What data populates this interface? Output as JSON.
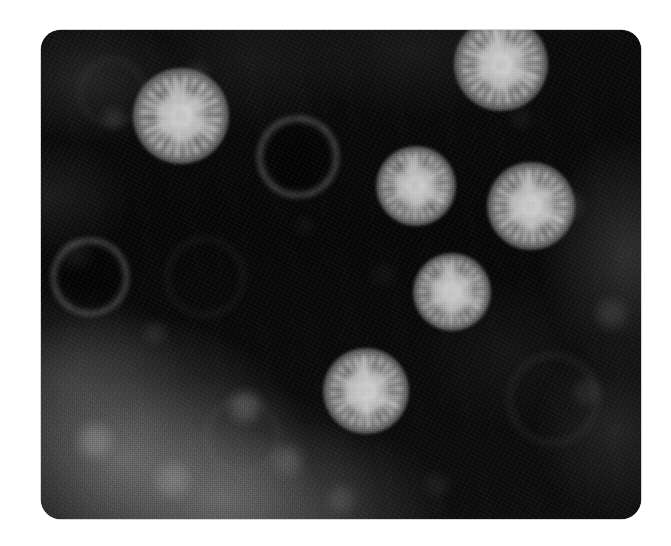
{
  "figure": {
    "kind": "transmission-electron-micrograph",
    "plate": {
      "x": 41,
      "y": 30,
      "width": 600,
      "height": 489,
      "corner_radius": 20,
      "background_color": "#070707",
      "page_color": "#ffffff"
    },
    "palette": {
      "page": "#ffffff",
      "stain_dark": "#060606",
      "stain_mid": "#4a4a4a",
      "capsid_bright": "#e8e8e8",
      "capsid_rim": "#9a9a9a"
    },
    "particles": [
      {
        "id": "particle-1",
        "type": "full",
        "cx": 181,
        "cy": 116,
        "r": 48
      },
      {
        "id": "particle-2",
        "type": "full",
        "cx": 501,
        "cy": 64,
        "r": 47
      },
      {
        "id": "particle-3",
        "type": "full",
        "cx": 416,
        "cy": 186,
        "r": 40
      },
      {
        "id": "particle-4",
        "type": "full",
        "cx": 531,
        "cy": 206,
        "r": 44
      },
      {
        "id": "particle-5",
        "type": "full",
        "cx": 452,
        "cy": 292,
        "r": 39
      },
      {
        "id": "particle-6",
        "type": "full",
        "cx": 366,
        "cy": 391,
        "r": 43
      },
      {
        "id": "particle-7",
        "type": "empty",
        "cx": 298,
        "cy": 157,
        "r": 41
      },
      {
        "id": "particle-8",
        "type": "empty",
        "cx": 90,
        "cy": 277,
        "r": 39
      },
      {
        "id": "particle-9",
        "type": "ghost",
        "cx": 205,
        "cy": 277,
        "r": 40
      },
      {
        "id": "particle-10",
        "type": "ghost",
        "cx": 553,
        "cy": 399,
        "r": 46
      },
      {
        "id": "particle-11",
        "type": "ghost",
        "cx": 242,
        "cy": 436,
        "r": 38
      },
      {
        "id": "particle-12",
        "type": "ghost",
        "cx": 112,
        "cy": 92,
        "r": 34
      }
    ],
    "regions": [
      {
        "id": "stain-pool-lower-left",
        "note": "granular mid-gray negative-stain pool"
      },
      {
        "id": "stain-pool-right-edge",
        "note": "faint gray stain along right margin"
      },
      {
        "id": "field-dark",
        "note": "dense dark stain background filling the field"
      }
    ]
  }
}
